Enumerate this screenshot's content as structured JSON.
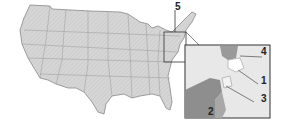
{
  "map": {
    "title": "",
    "region": "United States",
    "inset_region": "Northeast (Mid-Atlantic / New England)",
    "labels": [
      {
        "id": "5",
        "text": "5"
      },
      {
        "id": "4",
        "text": "4"
      },
      {
        "id": "1",
        "text": "1"
      },
      {
        "id": "3",
        "text": "3"
      },
      {
        "id": "2",
        "text": "2"
      }
    ],
    "colors": {
      "land": "#d8d8d8",
      "border": "#888888",
      "highlight_dark": "#8a8a8a",
      "highlight_mid": "#a8a8a8",
      "inset_bg": "#e6e6e6",
      "frame": "#333333"
    }
  }
}
